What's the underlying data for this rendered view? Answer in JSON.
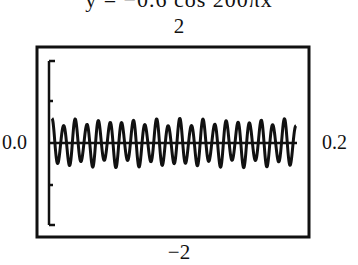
{
  "chart_data": {
    "type": "line",
    "title": "y = −0.6 cos 200πx",
    "xlabel": "",
    "ylabel": "",
    "xlim": [
      0.0,
      0.2
    ],
    "ylim": [
      -2,
      2
    ],
    "window_labels": {
      "xmin": "0.0",
      "xmax": "0.2",
      "ymin": "−2",
      "ymax": "2"
    },
    "y_ticks": [
      -1,
      1
    ],
    "grid": false,
    "legend": "none",
    "series": [
      {
        "name": "y = −0.6 cos 200πx",
        "amplitude": 0.6,
        "visible_peaks": 21,
        "note": "aliased graphing-calculator rendering of a high-frequency cosine"
      }
    ]
  },
  "labels": {
    "title": "y = −0.6 cos 200πx",
    "ymax": "2",
    "ymin": "−2",
    "xmin": "0.0",
    "xmax": "0.2"
  }
}
